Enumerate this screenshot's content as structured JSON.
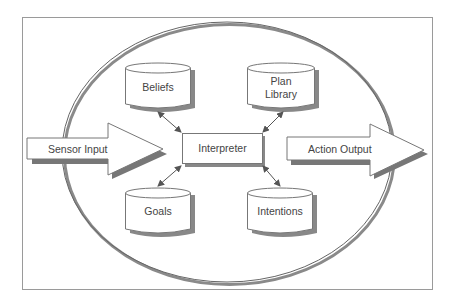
{
  "diagram": {
    "nodes": {
      "beliefs": {
        "label": "Beliefs"
      },
      "plan_library": {
        "label_line1": "Plan",
        "label_line2": "Library"
      },
      "interpreter": {
        "label": "Interpreter"
      },
      "goals": {
        "label": "Goals"
      },
      "intentions": {
        "label": "Intentions"
      }
    },
    "arrows": {
      "input": {
        "label": "Sensor Input"
      },
      "output": {
        "label": "Action Output"
      }
    },
    "edges": [
      {
        "from": "beliefs",
        "to": "interpreter",
        "direction": "both"
      },
      {
        "from": "plan_library",
        "to": "interpreter",
        "direction": "both"
      },
      {
        "from": "goals",
        "to": "interpreter",
        "direction": "both"
      },
      {
        "from": "intentions",
        "to": "interpreter",
        "direction": "both"
      }
    ],
    "colors": {
      "stroke": "#777777",
      "shadow": "#8a8a8a",
      "text": "#444444",
      "fill": "#ffffff"
    }
  }
}
